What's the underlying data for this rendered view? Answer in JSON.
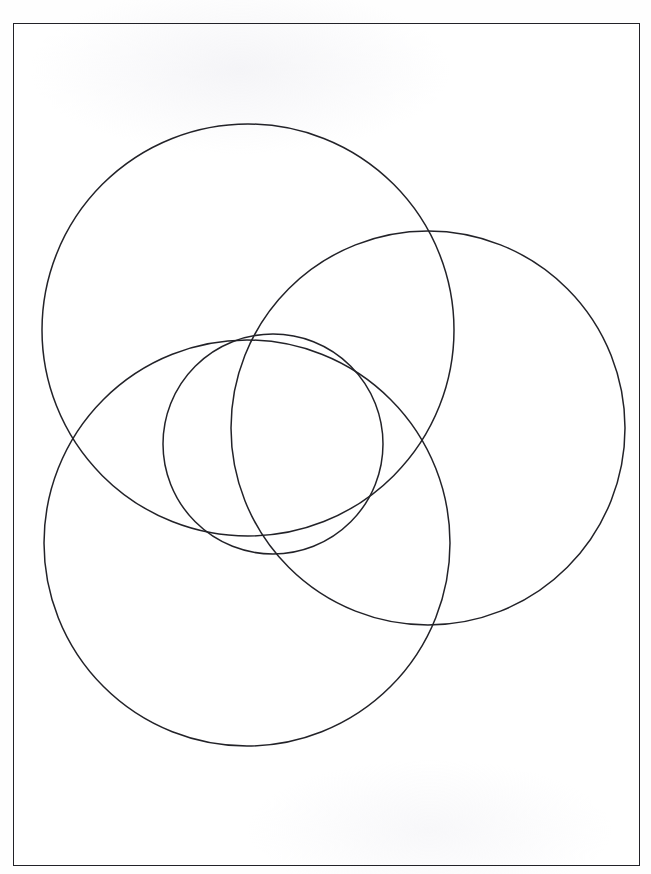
{
  "document": {
    "title": "Three overlapping circles diagram",
    "scan_header_text": "",
    "background_color": "#fdfdfd",
    "page_color": "#ffffff",
    "stroke_color": "#222228",
    "width": 651,
    "height": 874
  },
  "frame": {
    "name": "page-border",
    "x": 13,
    "y": 23,
    "width": 627,
    "height": 843,
    "border_color": "#222228",
    "border_width": 1.6
  },
  "diagram": {
    "type": "overlapping-circles",
    "stroke_color": "#222228",
    "stroke_width": 1.5,
    "fill": "none",
    "circle_count": 4,
    "circles": [
      {
        "id": "circle-top-left",
        "label": "",
        "cx": 248,
        "cy": 330,
        "r": 206,
        "stroke": "#222228",
        "stroke_width": 1.5,
        "fill": "none"
      },
      {
        "id": "circle-right",
        "label": "",
        "cx": 428,
        "cy": 428,
        "r": 197,
        "stroke": "#222228",
        "stroke_width": 1.5,
        "fill": "none"
      },
      {
        "id": "circle-bottom-left",
        "label": "",
        "cx": 247,
        "cy": 543,
        "r": 203,
        "stroke": "#222228",
        "stroke_width": 1.5,
        "fill": "none"
      },
      {
        "id": "circle-center-small",
        "label": "",
        "cx": 273,
        "cy": 444,
        "r": 110,
        "stroke": "#222228",
        "stroke_width": 1.5,
        "fill": "none"
      }
    ],
    "extents": {
      "circle-top-left": {
        "left": 42,
        "top": 124,
        "right": 454,
        "bottom": 536
      },
      "circle-right": {
        "left": 231,
        "top": 231,
        "right": 625,
        "bottom": 625
      },
      "circle-bottom-left": {
        "left": 44,
        "top": 340,
        "right": 450,
        "bottom": 746
      },
      "circle-center-small": {
        "left": 163,
        "top": 334,
        "right": 383,
        "bottom": 554
      }
    }
  }
}
